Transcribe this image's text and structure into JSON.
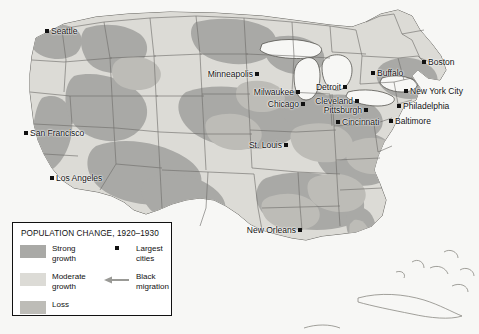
{
  "map": {
    "region": "United States",
    "colors": {
      "strong_growth": "#a9a9a6",
      "moderate_growth": "#dcdbd6",
      "loss": "#bdbcb7",
      "water": "#f7f7f5",
      "land_base": "#eceae5",
      "border": "#6f6e6a",
      "coast": "#55544f",
      "city_marker": "#111111",
      "legend_border": "#111111",
      "legend_bg": "#ffffff",
      "arrow": "#9a9a96"
    },
    "cities": [
      {
        "name": "Seattle",
        "x": 47,
        "y": 31,
        "label_pos": "right"
      },
      {
        "name": "San Francisco",
        "x": 26,
        "y": 133,
        "label_pos": "right"
      },
      {
        "name": "Los Angeles",
        "x": 52,
        "y": 178,
        "label_pos": "right"
      },
      {
        "name": "Minneapolis",
        "x": 257,
        "y": 74,
        "label_pos": "left"
      },
      {
        "name": "Milwaukee",
        "x": 298,
        "y": 92,
        "label_pos": "left"
      },
      {
        "name": "Chicago",
        "x": 303,
        "y": 104,
        "label_pos": "left"
      },
      {
        "name": "St. Louis",
        "x": 286,
        "y": 145,
        "label_pos": "left"
      },
      {
        "name": "Detroit",
        "x": 345,
        "y": 87,
        "label_pos": "left"
      },
      {
        "name": "Cleveland",
        "x": 357,
        "y": 101,
        "label_pos": "left"
      },
      {
        "name": "Pittsburgh",
        "x": 366,
        "y": 110,
        "label_pos": "left"
      },
      {
        "name": "Cincinnati",
        "x": 338,
        "y": 122,
        "label_pos": "right"
      },
      {
        "name": "Buffalo",
        "x": 373,
        "y": 73,
        "label_pos": "right"
      },
      {
        "name": "Boston",
        "x": 424,
        "y": 62,
        "label_pos": "right"
      },
      {
        "name": "New York City",
        "x": 406,
        "y": 91,
        "label_pos": "right"
      },
      {
        "name": "Philadelphia",
        "x": 399,
        "y": 106,
        "label_pos": "right"
      },
      {
        "name": "Baltimore",
        "x": 391,
        "y": 121,
        "label_pos": "right"
      },
      {
        "name": "New Orleans",
        "x": 300,
        "y": 230,
        "label_pos": "left"
      }
    ]
  },
  "legend": {
    "title": "POPULATION CHANGE, 1920–1930",
    "items": [
      {
        "key": "strong-growth",
        "label_line1": "Strong",
        "label_line2": "growth",
        "color": "#a9a9a6"
      },
      {
        "key": "moderate-growth",
        "label_line1": "Moderate",
        "label_line2": "growth",
        "color": "#dcdbd6"
      },
      {
        "key": "loss",
        "label_line1": "Loss",
        "label_line2": "",
        "color": "#bdbcb7"
      }
    ],
    "keys": [
      {
        "key": "largest-cities",
        "label_line1": "Largest",
        "label_line2": "cities",
        "symbol": "dot-icon"
      },
      {
        "key": "black-migration",
        "label_line1": "Black",
        "label_line2": "migration",
        "symbol": "left-arrow-icon"
      }
    ]
  }
}
